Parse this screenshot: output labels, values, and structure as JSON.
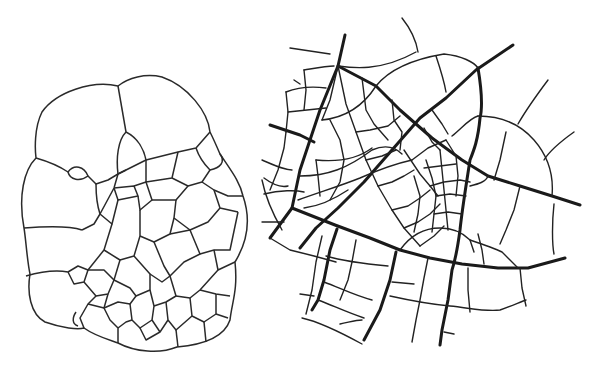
{
  "figure": {
    "panels": [
      {
        "id": "left",
        "label": "cell-tissue-drawing",
        "subject": "cellular tissue with polygonal cells"
      },
      {
        "id": "right",
        "label": "city-street-plan-drawing",
        "subject": "radial street network with main roads and side streets"
      }
    ],
    "colors": {
      "line": "#222222",
      "background": "#ffffff"
    }
  }
}
